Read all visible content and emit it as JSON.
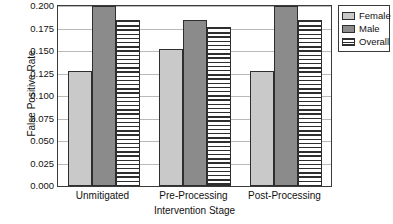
{
  "chart_data": {
    "type": "bar",
    "title": "",
    "xlabel": "Intervention Stage",
    "ylabel": "False Positive Rate",
    "categories": [
      "Unmitigated",
      "Pre-Processing",
      "Post-Processing"
    ],
    "series": [
      {
        "name": "Female",
        "values": [
          0.128,
          0.152,
          0.128
        ],
        "color": "#c9c9c9",
        "pattern": "solid"
      },
      {
        "name": "Male",
        "values": [
          0.2,
          0.184,
          0.2
        ],
        "color": "#8b8b8b",
        "pattern": "solid"
      },
      {
        "name": "Overall",
        "values": [
          0.184,
          0.177,
          0.184
        ],
        "color": "#ffffff",
        "pattern": "horizontal-stripes"
      }
    ],
    "ylim": [
      0.0,
      0.2
    ],
    "yticks": [
      0.0,
      0.025,
      0.05,
      0.075,
      0.1,
      0.125,
      0.15,
      0.175,
      0.2
    ],
    "ytick_labels": [
      "0.000",
      "0.025",
      "0.050",
      "0.075",
      "0.100",
      "0.125",
      "0.150",
      "0.175",
      "0.200"
    ],
    "grid": true,
    "legend_position": "outside-right-top"
  },
  "legend": {
    "entries": [
      {
        "label": "Female"
      },
      {
        "label": "Male"
      },
      {
        "label": "Overall"
      }
    ]
  }
}
